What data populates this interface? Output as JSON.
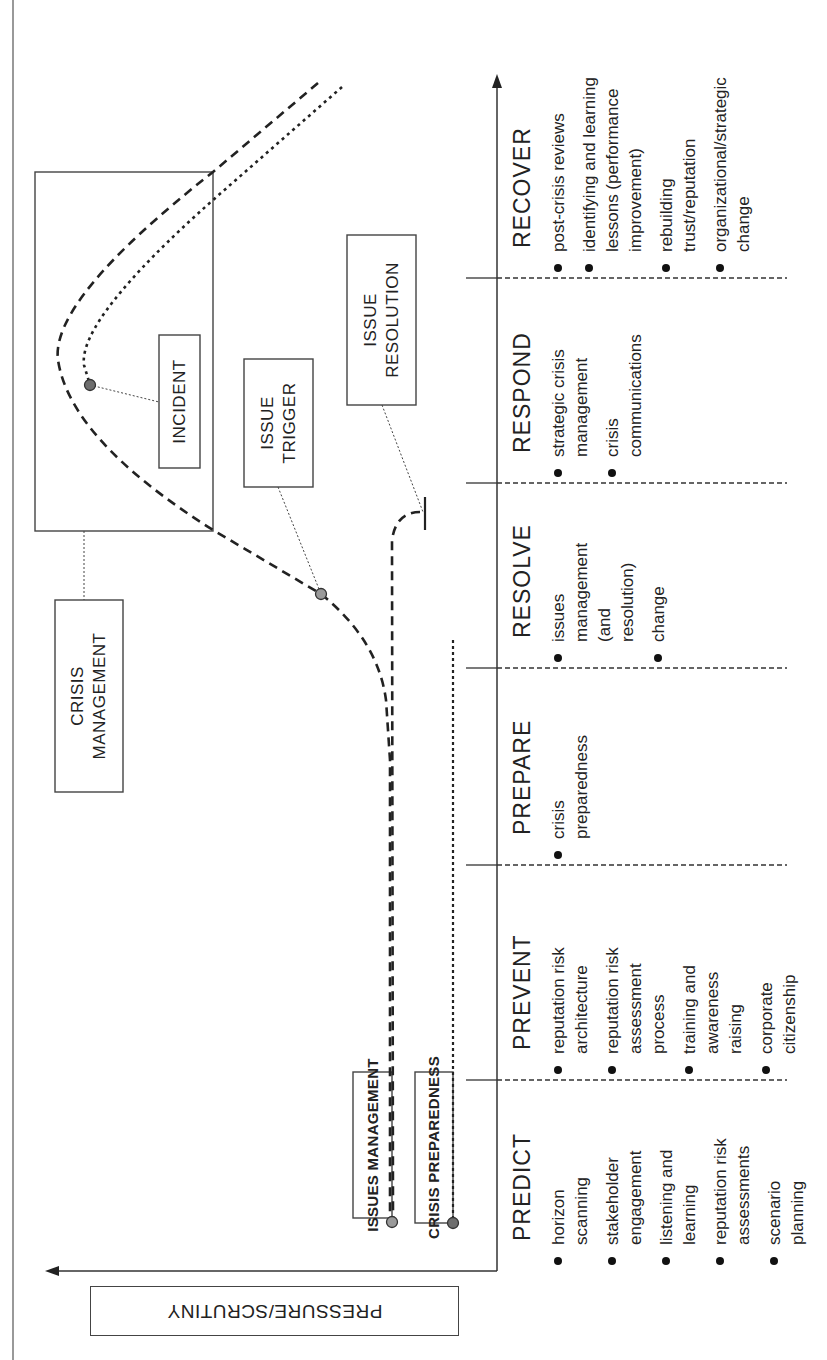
{
  "axes": {
    "y_axis_label": "PRESSURE/SCRUTINY",
    "x_axis": "time (phases)"
  },
  "boxes": {
    "crisis_management": "CRISIS\nMANAGEMENT",
    "incident": "INCIDENT",
    "issue_trigger": "ISSUE\nTRIGGER",
    "issue_resolution": "ISSUE\nRESOLUTION",
    "issues_management": "ISSUES MANAGEMENT",
    "crisis_preparedness": "CRISIS PREPAREDNESS"
  },
  "phases": [
    {
      "heading": "PREDICT",
      "items": [
        "horizon\nscanning",
        "stakeholder\nengagement",
        "listening and\nlearning",
        "reputation risk\nassessments",
        "scenario\nplanning"
      ]
    },
    {
      "heading": "PREVENT",
      "items": [
        "reputation risk\narchitecture",
        "reputation risk\nassessment\nprocess",
        "training and\nawareness\nraising",
        "corporate\ncitizenship"
      ]
    },
    {
      "heading": "PREPARE",
      "items": [
        "crisis\npreparedness"
      ]
    },
    {
      "heading": "RESOLVE",
      "items": [
        "issues\nmanagement\n(and\nresolution)",
        "change"
      ]
    },
    {
      "heading": "RESPOND",
      "items": [
        "strategic crisis\nmanagement",
        "crisis\ncommunications"
      ]
    },
    {
      "heading": "RECOVER",
      "items": [
        "post-crisis reviews",
        "identifying and learning\nlessons (performance\nimprovement)",
        "rebuilding\ntrust/reputation",
        "organizational/strategic\nchange"
      ]
    }
  ],
  "colors": {
    "line": "#333333",
    "dot_light": "#9a9a9a",
    "dot_dark": "#6e6e6e",
    "text": "#222222"
  }
}
